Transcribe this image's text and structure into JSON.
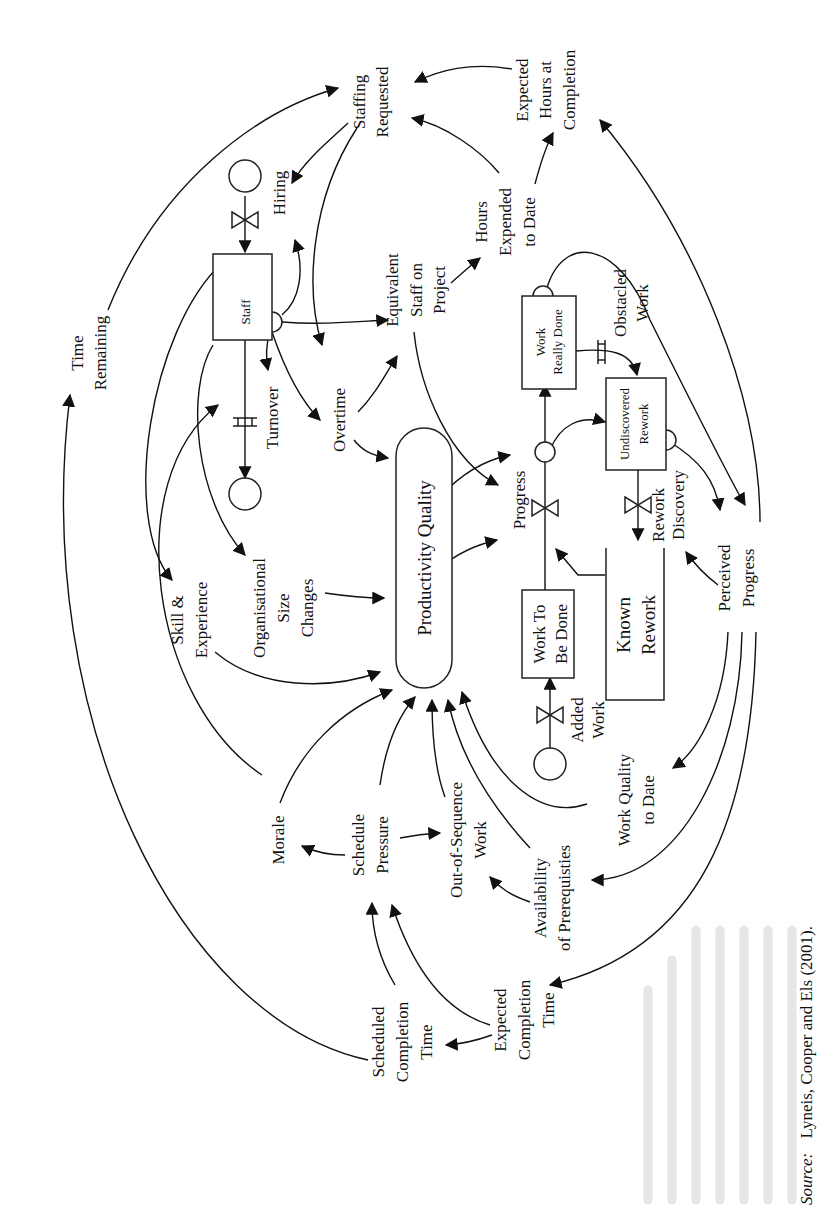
{
  "figure": {
    "orientation": "rotated 90 degrees counter-clockwise",
    "type": "system dynamics stock-and-flow diagram",
    "source_label": "Source:",
    "source_text": "Lyneis, Cooper and Els (2001)."
  },
  "stocks": {
    "staff": "Staff",
    "work_really_done_1": "Work",
    "work_really_done_2": "Really Done",
    "undiscovered_rework_1": "Undiscovered",
    "undiscovered_rework_2": "Rework",
    "work_to_be_done_1": "Work To",
    "work_to_be_done_2": "Be Done",
    "known_rework_1": "Known",
    "known_rework_2": "Rework",
    "productivity_quality": "Productivity Quality"
  },
  "flows": {
    "hiring": "Hiring",
    "turnover": "Turnover",
    "progress": "Progress",
    "obstacled_work_1": "Obstacled",
    "obstacled_work_2": "Work",
    "rework": "Rework",
    "discovery": "Discovery",
    "added_work_1": "Added",
    "added_work_2": "Work"
  },
  "variables": {
    "time_remaining_1": "Time",
    "time_remaining_2": "Remaining",
    "staffing_requested_1": "Staffing",
    "staffing_requested_2": "Requested",
    "expected_hours_1": "Expected",
    "expected_hours_2": "Hours at",
    "expected_hours_3": "Completion",
    "hours_expended_1": "Hours",
    "hours_expended_2": "Expended",
    "hours_expended_3": "to Date",
    "equivalent_staff_1": "Equivalent",
    "equivalent_staff_2": "Staff on",
    "equivalent_staff_3": "Project",
    "overtime": "Overtime",
    "org_size_1": "Organisational",
    "org_size_2": "Size",
    "org_size_3": "Changes",
    "skill_1": "Skill &",
    "skill_2": "Experience",
    "morale": "Morale",
    "schedule_pressure_1": "Schedule",
    "schedule_pressure_2": "Pressure",
    "out_of_sequence_1": "Out-of-Sequence",
    "out_of_sequence_2": "Work",
    "availability_1": "Availability",
    "availability_2": "of Prerequisties",
    "work_quality_1": "Work Quality",
    "work_quality_2": "to Date",
    "perceived_progress_1": "Perceived",
    "perceived_progress_2": "Progress",
    "scheduled_completion_1": "Scheduled",
    "scheduled_completion_2": "Completion",
    "scheduled_completion_3": "Time",
    "expected_completion_1": "Expected",
    "expected_completion_2": "Completion",
    "expected_completion_3": "Time"
  }
}
